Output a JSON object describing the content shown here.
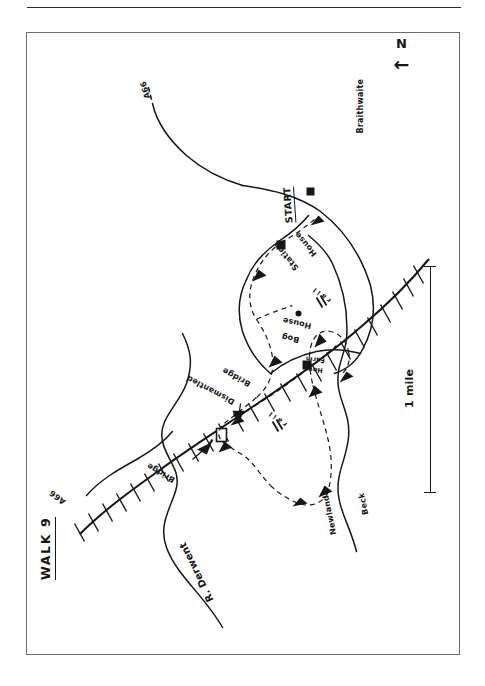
{
  "page": {
    "title_label": "WALK 9",
    "domain_kind": "hand-drawn sketch map",
    "ink_color": "#161616",
    "paper_color": "#ffffff",
    "frame_color": "#6d6d6d"
  },
  "compass": {
    "letter": "N",
    "arrow_glyph": "←",
    "name": "north-arrow"
  },
  "scale_bar": {
    "label": "1  mile",
    "distance_value": "1",
    "distance_unit": "mile"
  },
  "map_labels": [
    {
      "id": "walk-title",
      "text": "WALK  9"
    },
    {
      "id": "river-derwent",
      "text": "R. Derwent"
    },
    {
      "id": "newlands-beck",
      "text": "Newlands"
    },
    {
      "id": "newlands-beck-2",
      "text": "Beck"
    },
    {
      "id": "braithwaite",
      "text": "Braithwaite"
    },
    {
      "id": "start",
      "text": "START"
    },
    {
      "id": "station-house",
      "text": "Station"
    },
    {
      "id": "station-house-2",
      "text": "House"
    },
    {
      "id": "bog-house",
      "text": "Bog"
    },
    {
      "id": "bog-house-2",
      "text": "House"
    },
    {
      "id": "how-farm",
      "text": "How"
    },
    {
      "id": "how-farm-2",
      "text": "Farm"
    },
    {
      "id": "bridge",
      "text": "Bridge"
    },
    {
      "id": "dismantled-bridge",
      "text": "Dismantled"
    },
    {
      "id": "dismantled-bridge-2",
      "text": "Bridge"
    },
    {
      "id": "road-a66-north",
      "text": "A66"
    },
    {
      "id": "road-a66-south",
      "text": "A66"
    },
    {
      "id": "rail-marker-1",
      "text": "r a i l"
    },
    {
      "id": "rail-marker-2",
      "text": "r a i l"
    }
  ],
  "legend_meaning": {
    "solid_line": "road or river",
    "hatched_line": "dismantled railway / track",
    "dashed_line_with_arrows": "walking route direction",
    "filled_square": "building"
  }
}
